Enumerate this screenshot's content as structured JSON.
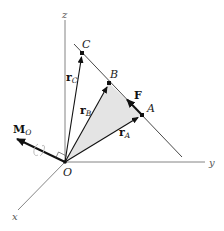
{
  "diagram": {
    "axes": {
      "x": {
        "label": "x"
      },
      "y": {
        "label": "y"
      },
      "z": {
        "label": "z"
      }
    },
    "origin": {
      "label": "O"
    },
    "points": {
      "A": {
        "label": "A"
      },
      "B": {
        "label": "B"
      },
      "C": {
        "label": "C"
      }
    },
    "vectors": {
      "rA": {
        "main": "r",
        "sub": "A"
      },
      "rB": {
        "main": "r",
        "sub": "B"
      },
      "rC": {
        "main": "r",
        "sub": "C"
      },
      "F": {
        "main": "F"
      },
      "MO": {
        "main": "M",
        "sub": "O"
      }
    },
    "colors": {
      "plane_fill": "#e4e4e4",
      "line": "#222222",
      "axis": "#777777",
      "rotation_arrow": "#bbbbbb"
    }
  }
}
